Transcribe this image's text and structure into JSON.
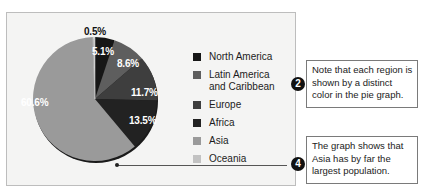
{
  "chart_data": {
    "type": "pie",
    "title": "",
    "categories": [
      "North America",
      "Latin America and Caribbean",
      "Europe",
      "Africa",
      "Asia",
      "Oceania"
    ],
    "values": [
      5.1,
      8.6,
      11.7,
      13.5,
      60.6,
      0.5
    ],
    "unit": "%",
    "labels": [
      "5.1%",
      "8.6%",
      "11.7%",
      "13.5%",
      "60.6%",
      "0.5%"
    ],
    "colors": [
      "#161616",
      "#5e5e5e",
      "#3e3e3e",
      "#222222",
      "#9a9a9a",
      "#c2c2c2"
    ],
    "legend_position": "right",
    "start_angle_deg": 0,
    "direction": "clockwise"
  },
  "legend": {
    "items": [
      {
        "label": "North America",
        "color": "#161616"
      },
      {
        "label": "Latin America and Caribbean",
        "color": "#5e5e5e"
      },
      {
        "label": "Europe",
        "color": "#3e3e3e"
      },
      {
        "label": "Africa",
        "color": "#222222"
      },
      {
        "label": "Asia",
        "color": "#9a9a9a"
      },
      {
        "label": "Oceania",
        "color": "#c2c2c2"
      }
    ]
  },
  "callouts": [
    {
      "number": "2",
      "text": "Note that each region is shown by a distinct color in the pie graph."
    },
    {
      "number": "4",
      "text": "The graph shows that Asia has by far the largest population."
    }
  ]
}
